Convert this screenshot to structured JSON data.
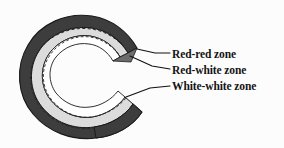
{
  "figure": {
    "background_color": "#fcfcfc"
  },
  "diagram": {
    "shape": "c-shaped-meniscus",
    "zones": [
      {
        "id": "red-red",
        "label": "Red-red zone",
        "fill_color": "#3d3d3d",
        "description": "outer peripheral vascular band"
      },
      {
        "id": "red-white",
        "label": "Red-white zone",
        "fill_color": "#dcdcdc",
        "description": "middle transitional band"
      },
      {
        "id": "white-white",
        "label": "White-white zone",
        "fill_color": "#ffffff",
        "description": "inner avascular band"
      }
    ],
    "outline_color": "#1a1a1a",
    "dashed_boundary_color": "#2a2a2a",
    "leader_line_color": "#111111"
  },
  "labels": {
    "items": [
      {
        "text": "Red-red zone",
        "leader_target": "upper-horn-outer"
      },
      {
        "text": "Red-white zone",
        "leader_target": "upper-horn-middle"
      },
      {
        "text": "White-white zone",
        "leader_target": "lower-horn-inner"
      }
    ]
  }
}
